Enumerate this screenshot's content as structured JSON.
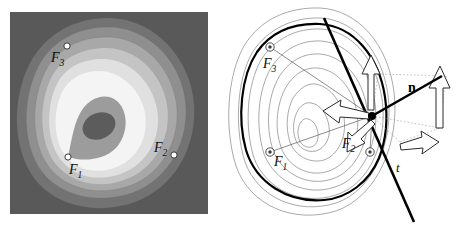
{
  "figure": {
    "panels": [
      {
        "id": "left",
        "name": "filled-level-set-panel",
        "description": "Grayscale filled contour bands of a three-focus distance-sum function on a dark gray square background",
        "background_color": "#595959",
        "band_colors": [
          "#6e6e6e",
          "#8e8e8e",
          "#a9a9a9",
          "#c2c2c2",
          "#dcdcdc",
          "#f2f2f2",
          "#9a9a9a",
          "#6b6b6b"
        ],
        "focus_marker_style": "open white dot",
        "labels": [
          {
            "text": "F",
            "sub": "3",
            "x": 53,
            "y": 57
          },
          {
            "text": "F",
            "sub": "1",
            "x": 72,
            "y": 168
          },
          {
            "text": "F",
            "sub": "2",
            "x": 160,
            "y": 149
          }
        ],
        "focus_points": [
          {
            "name": "F1",
            "x": 68,
            "y": 157
          },
          {
            "name": "F2",
            "x": 174,
            "y": 155
          },
          {
            "name": "F3",
            "x": 67,
            "y": 46
          }
        ]
      },
      {
        "id": "right",
        "name": "contour-tangent-panel",
        "description": "Line-drawing of the same level sets with one bold level curve, its tangent line t, the outward normal n, and the three unit vectors summing to n",
        "background_color": "#ffffff",
        "bold_curve_color": "#000000",
        "thin_curve_color": "#808080",
        "labels": [
          {
            "text": "F",
            "sub": "3",
            "x": 39,
            "y": 61
          },
          {
            "text": "F",
            "sub": "1",
            "x": 46,
            "y": 160
          },
          {
            "text": "F",
            "sub": "2",
            "x": 119,
            "y": 144
          },
          {
            "text": "n",
            "sub": "",
            "x": 186,
            "y": 86,
            "bold": true,
            "upright": true
          },
          {
            "text": "t",
            "sub": "",
            "x": 170,
            "y": 167
          }
        ],
        "focus_points": [
          {
            "name": "F1",
            "x": 42,
            "y": 152
          },
          {
            "name": "F2",
            "x": 142,
            "y": 152
          },
          {
            "name": "F3",
            "x": 42,
            "y": 47
          }
        ],
        "tangency_point": {
          "name": "P",
          "x": 144,
          "y": 116
        },
        "tangent_line_label": "t",
        "normal_vector_label": "n"
      }
    ],
    "symbols": {
      "focus_1": "F1",
      "focus_2": "F2",
      "focus_3": "F3",
      "normal": "n",
      "tangent": "t"
    }
  }
}
